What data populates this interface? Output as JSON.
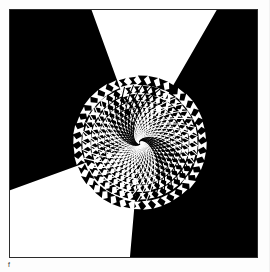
{
  "page": {
    "background_color": "#fdfdfd",
    "width": 270,
    "height": 272
  },
  "plate": {
    "title": "Vortex tessellation plate",
    "frame_color": "#2b2b2b",
    "frame_thickness_px": 1.5,
    "ink_color": "#000000",
    "paper_color": "#ffffff",
    "caption_mark": "f",
    "description": "Abstract black-and-white op-art tessellation: rows of bowtie / hourglass motifs radiate from a singular point near the centre, shrinking towards it; the figure-ground relationship inverts across the field so the left and upper-left read as black motifs on white while the right and lower-left read as white motifs on black."
  },
  "chart_data": {
    "type": "scatter",
    "xlabel": "",
    "ylabel": "",
    "xlim": [
      0,
      249
    ],
    "ylim": [
      0,
      249
    ],
    "grid": false,
    "legend": null,
    "annotations": [
      "singularity near plate-relative (131, 134)",
      "motif: bowtie / hourglass cell",
      "figure-ground inverts between quadrants"
    ],
    "singularity": {
      "x": 131,
      "y": 134
    },
    "rings": 26,
    "spokes": 40,
    "ring_spacing_growth": 1.17,
    "twist_per_ring_deg": 5.5,
    "inversion_field": {
      "mode": "angular",
      "white_on_black_sectors_deg": [
        [
          -60,
          95
        ],
        [
          160,
          250
        ]
      ],
      "black_on_white_sectors_deg": [
        [
          95,
          160
        ],
        [
          250,
          300
        ]
      ]
    }
  }
}
